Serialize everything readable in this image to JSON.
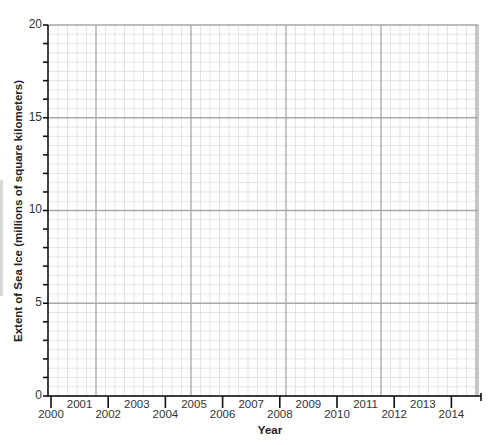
{
  "chart_data": {
    "type": "line",
    "title": "",
    "xlabel": "Year",
    "ylabel": "Extent of Sea Ice (millions of square kilometers)",
    "x_tick_labels": [
      "2000",
      "2001",
      "2002",
      "2003",
      "2004",
      "2005",
      "2006",
      "2007",
      "2008",
      "2009",
      "2010",
      "2011",
      "2012",
      "2013",
      "2014"
    ],
    "y_tick_labels": [
      "0",
      "5",
      "10",
      "15",
      "20"
    ],
    "xlim": [
      2000,
      2015
    ],
    "ylim": [
      0,
      20
    ],
    "grid": true,
    "series": [],
    "note": "Blank graph-paper grid; no data plotted"
  },
  "axes": {
    "x_title": "Year",
    "y_title": "Extent of Sea Ice (millions of square kilometers)",
    "y_labels": [
      "0",
      "5",
      "10",
      "15",
      "20"
    ],
    "x_labels": [
      "2000",
      "2001",
      "2002",
      "2003",
      "2004",
      "2005",
      "2006",
      "2007",
      "2008",
      "2009",
      "2010",
      "2011",
      "2012",
      "2013",
      "2014"
    ]
  },
  "colors": {
    "minor_grid": "#dcdcdc",
    "major_grid": "#a8a8a8",
    "axis": "#111111"
  }
}
